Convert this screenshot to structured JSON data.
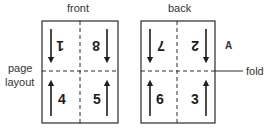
{
  "labels": {
    "front": "front",
    "back": "back",
    "page_layout_line1": "page",
    "page_layout_line2": "layout",
    "fold": "fold",
    "panel_marker": "A"
  },
  "front_sheet": {
    "pages": [
      {
        "position": "top-left",
        "number": "1",
        "orientation": "inverted",
        "arrow": "down"
      },
      {
        "position": "top-right",
        "number": "8",
        "orientation": "inverted",
        "arrow": "down"
      },
      {
        "position": "bottom-left",
        "number": "4",
        "orientation": "upright",
        "arrow": "up"
      },
      {
        "position": "bottom-right",
        "number": "5",
        "orientation": "upright",
        "arrow": "up"
      }
    ]
  },
  "back_sheet": {
    "pages": [
      {
        "position": "top-left",
        "number": "7",
        "orientation": "inverted",
        "arrow": "down"
      },
      {
        "position": "top-right",
        "number": "2",
        "orientation": "inverted",
        "arrow": "down"
      },
      {
        "position": "bottom-left",
        "number": "6",
        "orientation": "upright",
        "arrow": "up"
      },
      {
        "position": "bottom-right",
        "number": "3",
        "orientation": "upright",
        "arrow": "up"
      }
    ]
  },
  "colors": {
    "line": "#2a2a2a",
    "text": "#333333"
  }
}
